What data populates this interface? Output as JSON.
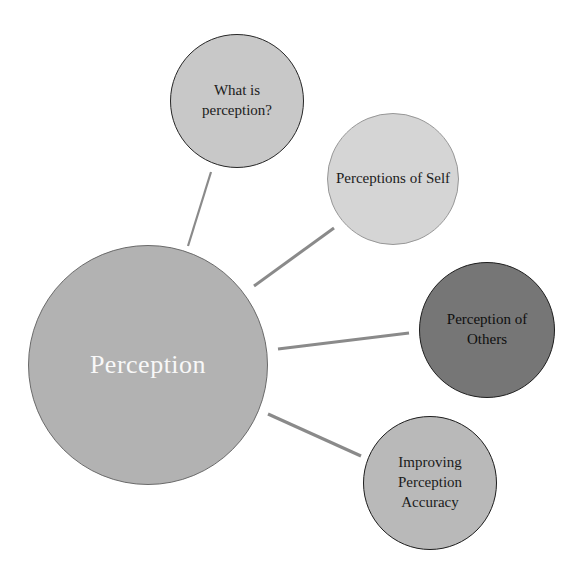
{
  "diagram": {
    "type": "radial-concept-map",
    "background": "#ffffff",
    "connector_color": "#8a8a8a",
    "center": {
      "label": "Perception",
      "fill": "#b2b2b2",
      "text_color": "#f8f8f8",
      "border_color": "#6a6a6a"
    },
    "branches": [
      {
        "id": "what-is-perception",
        "label": "What is\nperception?",
        "fill": "#c8c8c8",
        "text_color": "#1b1b1b",
        "border_color": "#262626"
      },
      {
        "id": "perceptions-of-self",
        "label": "Perceptions of Self",
        "fill": "#d5d5d5",
        "text_color": "#1b1b1b",
        "border_color": "#979797"
      },
      {
        "id": "perception-of-others",
        "label": "Perception of\nOthers",
        "fill": "#767676",
        "text_color": "#0f0f0f",
        "border_color": "#1d1d1d"
      },
      {
        "id": "improving-perception-accuracy",
        "label": "Improving\nPerception\nAccuracy",
        "fill": "#b9b9b9",
        "text_color": "#1b1b1b",
        "border_color": "#1d1d1d"
      }
    ]
  }
}
